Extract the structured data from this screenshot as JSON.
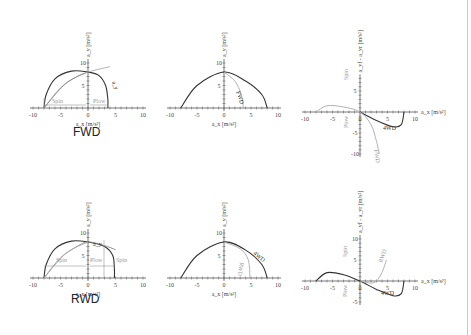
{
  "rows": [
    {
      "title": "FWD"
    },
    {
      "title": "RWD"
    }
  ],
  "chart_data": [
    {
      "type": "line",
      "panel": "FWD-friction-ellipse",
      "xlabel": "a_x [m/s²]",
      "ylabel": "a_y [m/s²]",
      "xlim": [
        -10,
        10
      ],
      "ylim": [
        0,
        10
      ],
      "xticks": [
        "-10",
        "-5",
        "0",
        "5",
        "10"
      ],
      "yticks": [
        "5",
        "10"
      ],
      "series": [
        {
          "name": "envelope",
          "color": "#333333",
          "points": [
            [
              -8,
              0
            ],
            [
              -7.6,
              3
            ],
            [
              -6,
              6.5
            ],
            [
              -3,
              8.2
            ],
            [
              0,
              8
            ],
            [
              2,
              7.2
            ],
            [
              3.2,
              5
            ],
            [
              3.6,
              2
            ],
            [
              3.6,
              0
            ]
          ]
        },
        {
          "name": "g-line",
          "color": "#aaaaaa",
          "points": [
            [
              -8,
              0
            ],
            [
              -5,
              4.5
            ],
            [
              -2,
              7
            ],
            [
              0,
              8
            ],
            [
              4,
              9.2
            ]
          ]
        },
        {
          "name": "inner-curve",
          "color": "#888888",
          "points": [
            [
              -8,
              0
            ],
            [
              -4,
              5.5
            ],
            [
              0,
              8
            ]
          ]
        }
      ],
      "annotations": [
        "Spin",
        "Plow",
        "a_y",
        "a_x",
        "a_y"
      ]
    },
    {
      "type": "line",
      "panel": "FWD-gg",
      "xlabel": "a_x [m/s²]",
      "ylabel": "a_y [m/s²]",
      "xlim": [
        -10,
        10
      ],
      "ylim": [
        0,
        10
      ],
      "xticks": [
        "-10",
        "-5",
        "0",
        "5",
        "10"
      ],
      "yticks": [
        "5",
        "10"
      ],
      "series": [
        {
          "name": "4WD",
          "color": "#333333",
          "points": [
            [
              -8,
              0
            ],
            [
              -5,
              5
            ],
            [
              0,
              8
            ],
            [
              4,
              6
            ],
            [
              7,
              3
            ],
            [
              8,
              0
            ]
          ]
        },
        {
          "name": "FWD",
          "color": "#aaaaaa",
          "points": [
            [
              0,
              8
            ],
            [
              2,
              6
            ],
            [
              3.2,
              3
            ],
            [
              3.6,
              0
            ]
          ]
        }
      ],
      "annotations": [
        "FWD"
      ]
    },
    {
      "type": "line",
      "panel": "FWD-balance",
      "xlabel": "a_x [m/s²]",
      "ylabel": "a_yf - a_yr [m/s²]",
      "xlim": [
        -10,
        10
      ],
      "ylim": [
        -10,
        8
      ],
      "xticks": [
        "-10",
        "-5",
        "0",
        "5",
        "10"
      ],
      "yticks": [
        "5",
        "-5",
        "-10"
      ],
      "series": [
        {
          "name": "4WD",
          "color": "#333333",
          "points": [
            [
              0,
              0
            ],
            [
              3,
              -2
            ],
            [
              6,
              -3.5
            ],
            [
              7.5,
              -3
            ],
            [
              8,
              0
            ]
          ]
        },
        {
          "name": "FWD",
          "color": "#aaaaaa",
          "points": [
            [
              -8,
              0
            ],
            [
              -6,
              1.5
            ],
            [
              -3,
              1.2
            ],
            [
              0,
              0
            ],
            [
              2,
              -3
            ],
            [
              3,
              -7
            ],
            [
              3.5,
              -10
            ]
          ]
        }
      ],
      "annotations": [
        "Spin",
        "Plow",
        "4WD",
        "FWD"
      ]
    },
    {
      "type": "line",
      "panel": "RWD-friction-ellipse",
      "xlabel": "a_x [m/s²]",
      "ylabel": "a_y [m/s²]",
      "xlim": [
        -10,
        10
      ],
      "ylim": [
        0,
        10
      ],
      "xticks": [
        "-10",
        "-5",
        "0",
        "5",
        "10"
      ],
      "yticks": [
        "5",
        "10"
      ],
      "series": [
        {
          "name": "envelope",
          "color": "#333333",
          "points": [
            [
              -8,
              0
            ],
            [
              -7.6,
              3
            ],
            [
              -6,
              6.5
            ],
            [
              -3,
              8.2
            ],
            [
              0,
              8
            ],
            [
              3,
              7
            ],
            [
              4.5,
              5
            ],
            [
              4.8,
              2
            ],
            [
              4.8,
              0
            ]
          ]
        },
        {
          "name": "g-line",
          "color": "#888888",
          "points": [
            [
              -8,
              0
            ],
            [
              -5,
              4.5
            ],
            [
              -2,
              7
            ],
            [
              0,
              8
            ],
            [
              3,
              7.2
            ],
            [
              5,
              6.3
            ]
          ]
        },
        {
          "name": "inner-curve",
          "color": "#aaaaaa",
          "points": [
            [
              -8,
              0
            ],
            [
              -4,
              5.5
            ],
            [
              0,
              8
            ]
          ]
        }
      ],
      "annotations": [
        "Spin",
        "Plow",
        "Spin",
        "a_y",
        "a_x"
      ]
    },
    {
      "type": "line",
      "panel": "RWD-gg",
      "xlabel": "a_x [m/s²]",
      "ylabel": "a_y [m/s²]",
      "xlim": [
        -10,
        10
      ],
      "ylim": [
        0,
        10
      ],
      "xticks": [
        "-10",
        "-5",
        "0",
        "5",
        "10"
      ],
      "yticks": [
        "5",
        "10"
      ],
      "series": [
        {
          "name": "4WD",
          "color": "#333333",
          "points": [
            [
              -8,
              0
            ],
            [
              -5,
              5
            ],
            [
              0,
              8
            ],
            [
              4,
              6.2
            ],
            [
              7,
              3
            ],
            [
              8,
              0
            ]
          ]
        },
        {
          "name": "RWD",
          "color": "#aaaaaa",
          "points": [
            [
              0,
              8
            ],
            [
              3,
              6.5
            ],
            [
              4.5,
              4
            ],
            [
              4.8,
              0
            ]
          ]
        }
      ],
      "annotations": [
        "4WD",
        "RWD"
      ]
    },
    {
      "type": "line",
      "panel": "RWD-balance",
      "xlabel": "a_x [m/s²]",
      "ylabel": "a_yf - a_yr [m/s²]",
      "xlim": [
        -10,
        10
      ],
      "ylim": [
        -5,
        10
      ],
      "xticks": [
        "-10",
        "-5",
        "0",
        "5",
        "10"
      ],
      "yticks": [
        "10",
        "5",
        "-5"
      ],
      "series": [
        {
          "name": "4WD",
          "color": "#333333",
          "points": [
            [
              -8,
              0
            ],
            [
              -6,
              2
            ],
            [
              -3,
              1.5
            ],
            [
              0,
              0
            ],
            [
              3,
              -2
            ],
            [
              6,
              -3.5
            ],
            [
              7.5,
              -3
            ],
            [
              8,
              0
            ]
          ]
        },
        {
          "name": "RWD",
          "color": "#aaaaaa",
          "points": [
            [
              0,
              0
            ],
            [
              2,
              -0.5
            ],
            [
              3,
              0
            ],
            [
              4,
              2
            ],
            [
              4.8,
              5
            ]
          ]
        }
      ],
      "annotations": [
        "Spin",
        "Plow",
        "4WD",
        "RWD"
      ]
    }
  ]
}
